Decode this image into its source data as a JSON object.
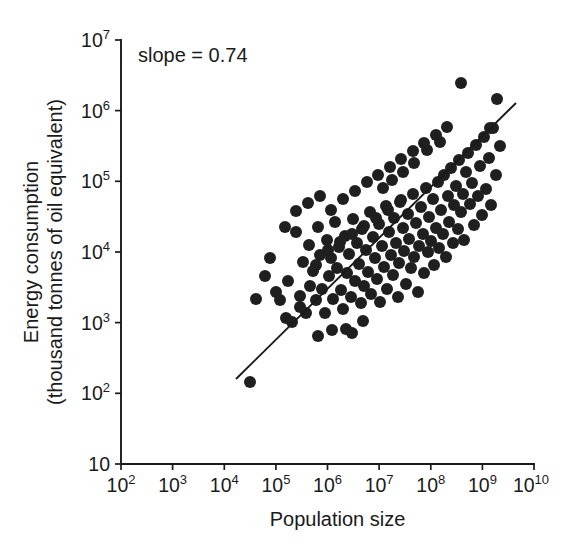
{
  "chart_data": {
    "type": "scatter",
    "title": "",
    "xlabel": "Population size",
    "ylabel": "Energy consumption (thousand tonnes of oil equivalent)",
    "ylabel_line1": "Energy consumption",
    "ylabel_line2": "(thousand tonnes of oil equivalent)",
    "xscale": "log",
    "yscale": "log",
    "xlim": [
      100,
      10000000000
    ],
    "ylim": [
      10,
      10000000
    ],
    "grid": false,
    "legend": null,
    "annotations": [
      {
        "name": "slope-annotation",
        "text": "slope = 0.74",
        "x_px": 138,
        "y_px": 62
      }
    ],
    "xticks": [
      {
        "value": 100,
        "label_mantissa": "10",
        "label_exp": "2",
        "x_px": 121
      },
      {
        "value": 1000,
        "label_mantissa": "10",
        "label_exp": "3",
        "x_px": 172.6
      },
      {
        "value": 10000,
        "label_mantissa": "10",
        "label_exp": "4",
        "x_px": 224.3
      },
      {
        "value": 100000,
        "label_mantissa": "10",
        "label_exp": "5",
        "x_px": 275.9
      },
      {
        "value": 1000000,
        "label_mantissa": "10",
        "label_exp": "6",
        "x_px": 327.5
      },
      {
        "value": 10000000,
        "label_mantissa": "10",
        "label_exp": "7",
        "x_px": 379.1
      },
      {
        "value": 100000000,
        "label_mantissa": "10",
        "label_exp": "8",
        "x_px": 430.8
      },
      {
        "value": 1000000000,
        "label_mantissa": "10",
        "label_exp": "9",
        "x_px": 482.4
      },
      {
        "value": 10000000000,
        "label_mantissa": "10",
        "label_exp": "10",
        "x_px": 534
      }
    ],
    "yticks": [
      {
        "value": 10,
        "label_mantissa": "10",
        "label_exp": "",
        "y_px": 464
      },
      {
        "value": 100,
        "label_mantissa": "10",
        "label_exp": "2",
        "y_px": 393.3
      },
      {
        "value": 1000,
        "label_mantissa": "10",
        "label_exp": "3",
        "y_px": 322.6
      },
      {
        "value": 10000,
        "label_mantissa": "10",
        "label_exp": "4",
        "y_px": 252
      },
      {
        "value": 100000,
        "label_mantissa": "10",
        "label_exp": "5",
        "y_px": 181.3
      },
      {
        "value": 1000000,
        "label_mantissa": "10",
        "label_exp": "6",
        "y_px": 110.6
      },
      {
        "value": 10000000,
        "label_mantissa": "10",
        "label_exp": "7",
        "y_px": 40
      }
    ],
    "fit_line": {
      "name": "regression-line",
      "slope": 0.74,
      "x1_px": 236,
      "y1_px": 379,
      "x2_px": 516,
      "y2_px": 103
    },
    "marker": {
      "shape": "circle",
      "radius_px": 6.0,
      "color": "#1f1f1f"
    },
    "points_px": [
      [
        250,
        382
      ],
      [
        270,
        258
      ],
      [
        280,
        300
      ],
      [
        288,
        281
      ],
      [
        292,
        322
      ],
      [
        296,
        232
      ],
      [
        300,
        296
      ],
      [
        303,
        262
      ],
      [
        306,
        313
      ],
      [
        309,
        245
      ],
      [
        310,
        286
      ],
      [
        313,
        271
      ],
      [
        316,
        300
      ],
      [
        318,
        227
      ],
      [
        320,
        255
      ],
      [
        322,
        289
      ],
      [
        325,
        313
      ],
      [
        327,
        240
      ],
      [
        329,
        276
      ],
      [
        331,
        258
      ],
      [
        333,
        299
      ],
      [
        335,
        222
      ],
      [
        337,
        268
      ],
      [
        339,
        247
      ],
      [
        341,
        290
      ],
      [
        343,
        309
      ],
      [
        345,
        236
      ],
      [
        347,
        273
      ],
      [
        349,
        254
      ],
      [
        351,
        297
      ],
      [
        353,
        219
      ],
      [
        355,
        281
      ],
      [
        357,
        243
      ],
      [
        359,
        264
      ],
      [
        361,
        303
      ],
      [
        362,
        229
      ],
      [
        364,
        286
      ],
      [
        366,
        250
      ],
      [
        368,
        272
      ],
      [
        370,
        212
      ],
      [
        371,
        294
      ],
      [
        373,
        237
      ],
      [
        375,
        258
      ],
      [
        377,
        279
      ],
      [
        379,
        224
      ],
      [
        380,
        302
      ],
      [
        382,
        246
      ],
      [
        384,
        267
      ],
      [
        386,
        206
      ],
      [
        387,
        289
      ],
      [
        389,
        232
      ],
      [
        391,
        255
      ],
      [
        393,
        275
      ],
      [
        394,
        218
      ],
      [
        396,
        243
      ],
      [
        398,
        297
      ],
      [
        399,
        263
      ],
      [
        401,
        200
      ],
      [
        403,
        228
      ],
      [
        404,
        251
      ],
      [
        406,
        284
      ],
      [
        408,
        214
      ],
      [
        409,
        239
      ],
      [
        411,
        268
      ],
      [
        413,
        194
      ],
      [
        414,
        257
      ],
      [
        416,
        223
      ],
      [
        418,
        292
      ],
      [
        419,
        246
      ],
      [
        421,
        207
      ],
      [
        423,
        234
      ],
      [
        424,
        273
      ],
      [
        426,
        188
      ],
      [
        428,
        252
      ],
      [
        429,
        217
      ],
      [
        431,
        241
      ],
      [
        433,
        199
      ],
      [
        434,
        265
      ],
      [
        436,
        228
      ],
      [
        438,
        182
      ],
      [
        439,
        248
      ],
      [
        441,
        210
      ],
      [
        443,
        234
      ],
      [
        444,
        175
      ],
      [
        446,
        257
      ],
      [
        448,
        196
      ],
      [
        449,
        222
      ],
      [
        451,
        168
      ],
      [
        453,
        243
      ],
      [
        454,
        205
      ],
      [
        456,
        186
      ],
      [
        458,
        229
      ],
      [
        459,
        160
      ],
      [
        461,
        212
      ],
      [
        463,
        194
      ],
      [
        464,
        240
      ],
      [
        466,
        172
      ],
      [
        468,
        153
      ],
      [
        470,
        204
      ],
      [
        472,
        183
      ],
      [
        474,
        225
      ],
      [
        476,
        145
      ],
      [
        478,
        196
      ],
      [
        480,
        166
      ],
      [
        482,
        215
      ],
      [
        484,
        137
      ],
      [
        486,
        189
      ],
      [
        489,
        158
      ],
      [
        491,
        205
      ],
      [
        493,
        128
      ],
      [
        496,
        175
      ],
      [
        500,
        146
      ],
      [
        461,
        83
      ],
      [
        497,
        99
      ],
      [
        490,
        128
      ],
      [
        440,
        142
      ],
      [
        427,
        150
      ],
      [
        414,
        163
      ],
      [
        403,
        172
      ],
      [
        392,
        180
      ],
      [
        383,
        188
      ],
      [
        346,
        329
      ],
      [
        352,
        333
      ],
      [
        363,
        321
      ],
      [
        332,
        330
      ],
      [
        318,
        336
      ],
      [
        300,
        307
      ],
      [
        286,
        318
      ],
      [
        276,
        292
      ],
      [
        265,
        276
      ],
      [
        256,
        299
      ],
      [
        285,
        227
      ],
      [
        296,
        211
      ],
      [
        308,
        203
      ],
      [
        320,
        196
      ],
      [
        331,
        210
      ],
      [
        343,
        199
      ],
      [
        355,
        191
      ],
      [
        367,
        182
      ],
      [
        378,
        175
      ],
      [
        390,
        167
      ],
      [
        401,
        159
      ],
      [
        413,
        151
      ],
      [
        424,
        143
      ],
      [
        436,
        135
      ],
      [
        447,
        127
      ],
      [
        316,
        265
      ],
      [
        328,
        250
      ],
      [
        340,
        242
      ],
      [
        352,
        234
      ],
      [
        364,
        226
      ],
      [
        376,
        218
      ],
      [
        388,
        210
      ],
      [
        400,
        202
      ]
    ]
  }
}
